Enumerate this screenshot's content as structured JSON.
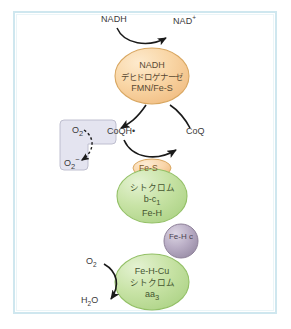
{
  "figure": {
    "border_color": "#cfe7ef",
    "background_color": "#ffffff"
  },
  "labels": {
    "nadh_in": "NADH",
    "nad_plus": "NAD",
    "nad_plus_sup": "+",
    "coq_oxidized": "CoQ",
    "coqh_radical": "CoQH•",
    "o2_box_top": "O",
    "o2_box_top_sub": "2",
    "superoxide": "O",
    "superoxide_sub": "2",
    "superoxide_sup": "−",
    "o2_bottom": "O",
    "o2_bottom_sub": "2",
    "water": "H",
    "water_sub": "2",
    "water_tail": "O"
  },
  "complexes": {
    "nadh_dehydrogenase": {
      "name": "nadh-dehydrogenase-complex",
      "line1": "NADH",
      "line2": "デヒドロゲナーゼ",
      "line3": "FMN/Fe-S",
      "fill": "#f8d2a0",
      "stroke": "#d8a05a"
    },
    "cytochrome_bc1": {
      "name": "cytochrome-bc1-complex",
      "badge": "Fe-S",
      "line1": "シトクロム",
      "line2_main": "b-c",
      "line2_sub": "1",
      "line3": "Fe-H",
      "fill": "#c3e0a0",
      "stroke": "#8fbf60"
    },
    "cytochrome_c": {
      "name": "cytochrome-c-sphere",
      "line1": "Fe-H",
      "line2": "c",
      "fill": "#b8acc4",
      "stroke": "#8f8299"
    },
    "cytochrome_aa3": {
      "name": "cytochrome-aa3-complex",
      "line1": "Fe-H-Cu",
      "line2": "シトクロム",
      "line3_main": "aa",
      "line3_sub": "3",
      "fill": "#c3e0a0",
      "stroke": "#8fbf60"
    }
  },
  "ros_box": {
    "name": "reactive-oxygen-species-box",
    "fill": "#e2e2ee",
    "stroke": "#b5b5c8"
  },
  "colors": {
    "arrow": "#1a1a1a",
    "frame": "#cfe7ef",
    "orange_complex": "#f8d2a0",
    "green_complex": "#c3e0a0",
    "purple_sphere": "#b8acc4",
    "lavender_box": "#e2e2ee"
  }
}
